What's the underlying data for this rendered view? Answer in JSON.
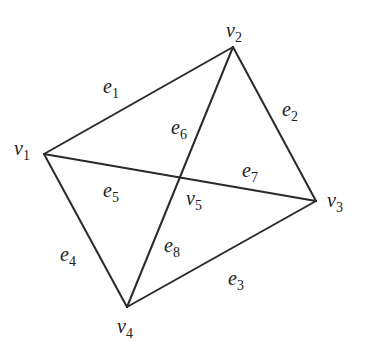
{
  "diagram": {
    "type": "graph",
    "vertices": [
      {
        "id": "v1",
        "base": "v",
        "sub": "1",
        "x": 44,
        "y": 154,
        "lx": 14,
        "ly": 138
      },
      {
        "id": "v2",
        "base": "v",
        "sub": "2",
        "x": 233,
        "y": 47,
        "lx": 226,
        "ly": 20
      },
      {
        "id": "v3",
        "base": "v",
        "sub": "3",
        "x": 316,
        "y": 201,
        "lx": 327,
        "ly": 190
      },
      {
        "id": "v4",
        "base": "v",
        "sub": "4",
        "x": 127,
        "y": 307,
        "lx": 117,
        "ly": 316
      },
      {
        "id": "v5",
        "base": "v",
        "sub": "5",
        "x": 178,
        "y": 178,
        "lx": 186,
        "ly": 188
      }
    ],
    "edges": [
      {
        "id": "e1",
        "base": "e",
        "sub": "1",
        "from": "v1",
        "to": "v2",
        "lx": 103,
        "ly": 76
      },
      {
        "id": "e2",
        "base": "e",
        "sub": "2",
        "from": "v2",
        "to": "v3",
        "lx": 282,
        "ly": 99
      },
      {
        "id": "e3",
        "base": "e",
        "sub": "3",
        "from": "v3",
        "to": "v4",
        "lx": 228,
        "ly": 268
      },
      {
        "id": "e4",
        "base": "e",
        "sub": "4",
        "from": "v4",
        "to": "v1",
        "lx": 60,
        "ly": 244
      },
      {
        "id": "e5",
        "base": "e",
        "sub": "5",
        "from": "v1",
        "to": "v5",
        "lx": 103,
        "ly": 180
      },
      {
        "id": "e6",
        "base": "e",
        "sub": "6",
        "from": "v5",
        "to": "v2",
        "lx": 171,
        "ly": 117
      },
      {
        "id": "e7",
        "base": "e",
        "sub": "7",
        "from": "v5",
        "to": "v3",
        "lx": 242,
        "ly": 160
      },
      {
        "id": "e8",
        "base": "e",
        "sub": "8",
        "from": "v4",
        "to": "v5",
        "lx": 164,
        "ly": 235
      }
    ],
    "lines": [
      {
        "from": "v1",
        "to": "v2"
      },
      {
        "from": "v2",
        "to": "v3"
      },
      {
        "from": "v3",
        "to": "v4"
      },
      {
        "from": "v4",
        "to": "v1"
      },
      {
        "from": "v1",
        "to": "v3"
      },
      {
        "from": "v2",
        "to": "v4"
      }
    ],
    "stroke_color": "#2a2a2a"
  }
}
